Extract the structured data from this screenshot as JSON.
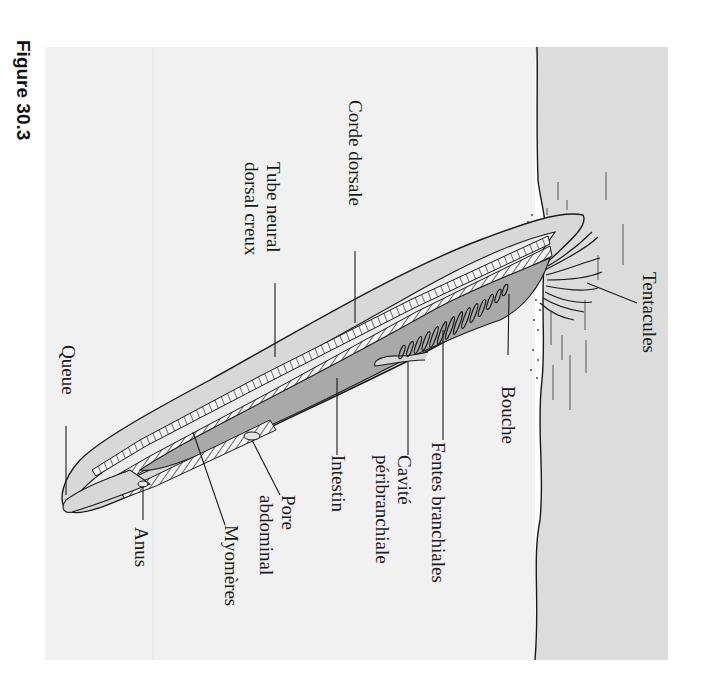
{
  "figure": {
    "label": "Figure 30.3",
    "orientation": "rotated 90° clockwise"
  },
  "diagram": {
    "labels": [
      {
        "id": "tentacules",
        "text": "Tentacules"
      },
      {
        "id": "bouche",
        "text": "Bouche"
      },
      {
        "id": "fentes-branchiales",
        "text": "Fentes branchiales"
      },
      {
        "id": "cavite-1",
        "text": "Cavité"
      },
      {
        "id": "cavite-2",
        "text": "péribranchiale"
      },
      {
        "id": "intestin",
        "text": "Intestin"
      },
      {
        "id": "pore-1",
        "text": "Pore"
      },
      {
        "id": "pore-2",
        "text": "abdominal"
      },
      {
        "id": "myomeres",
        "text": "Myomères"
      },
      {
        "id": "anus",
        "text": "Anus"
      },
      {
        "id": "queue",
        "text": "Queue"
      },
      {
        "id": "corde-dorsale",
        "text": "Corde dorsale"
      },
      {
        "id": "tube-1",
        "text": "Tube neural"
      },
      {
        "id": "tube-2",
        "text": "dorsal creux"
      }
    ]
  },
  "colors": {
    "water": "#f0f0f0",
    "sediment": "#dcdcdc",
    "body_outer": "#d6d6d6",
    "body_inner": "#ececec",
    "pharynx": "#a8a8a8",
    "line": "#1a1a1a"
  }
}
